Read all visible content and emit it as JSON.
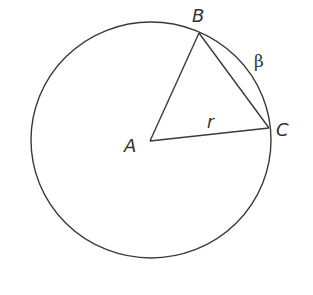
{
  "diagram": {
    "type": "circle-geometry",
    "circle": {
      "cx": 151,
      "cy": 140,
      "rx": 120,
      "ry": 118
    },
    "points": {
      "A": {
        "x": 150,
        "y": 141,
        "label": "A",
        "lx": 125,
        "ly": 152
      },
      "B": {
        "x": 199,
        "y": 33,
        "label": "B",
        "lx": 192,
        "ly": 24
      },
      "C": {
        "x": 269,
        "y": 128,
        "label": "C",
        "lx": 276,
        "ly": 137
      }
    },
    "labels": {
      "radius": "r",
      "arc": "β",
      "A": "A",
      "B": "B",
      "C": "C"
    },
    "segments": [
      "AB",
      "AC",
      "BC"
    ],
    "colors": {
      "stroke": "#3a3a3a",
      "text": "#333333",
      "background": "#ffffff"
    }
  }
}
